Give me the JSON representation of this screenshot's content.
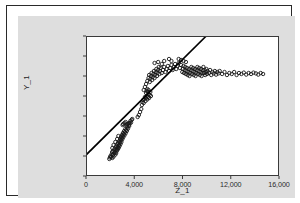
{
  "figure": {
    "background_color": "#dedede",
    "plot_background_color": "#ffffff",
    "frame_color": "#2a2a2a",
    "marker_color": "#1a1a1a",
    "line_color": "#000000"
  },
  "chart_data": {
    "type": "scatter",
    "title": "",
    "xlabel": "Z_1",
    "ylabel": "Y_1",
    "xlim": [
      0,
      16000
    ],
    "ylim": [
      1000,
      8000
    ],
    "xticks": [
      0,
      4000,
      8000,
      12000,
      16000
    ],
    "yticks": [
      1000,
      2000,
      3000,
      4000,
      5000,
      6000,
      7000,
      8000
    ],
    "xtick_labels": [
      "0",
      "4,000",
      "8,000",
      "12,000",
      "16,000"
    ],
    "ytick_labels": [
      "1,000",
      "2,000",
      "3,000",
      "4,000",
      "5,000",
      "6,000",
      "7,000",
      "8,000"
    ],
    "grid": false,
    "legend": null,
    "marker_style": "open-circle",
    "series": [
      {
        "name": "observations",
        "points": [
          [
            1850,
            1900
          ],
          [
            1900,
            1980
          ],
          [
            1950,
            2050
          ],
          [
            2000,
            2000
          ],
          [
            2050,
            2150
          ],
          [
            2080,
            2250
          ],
          [
            2100,
            1950
          ],
          [
            2150,
            2100
          ],
          [
            2180,
            2300
          ],
          [
            2200,
            2020
          ],
          [
            2250,
            2180
          ],
          [
            2280,
            2400
          ],
          [
            2300,
            2250
          ],
          [
            2350,
            2120
          ],
          [
            2380,
            2350
          ],
          [
            2400,
            2480
          ],
          [
            2420,
            2200
          ],
          [
            2450,
            2550
          ],
          [
            2480,
            2320
          ],
          [
            2500,
            2420
          ],
          [
            2520,
            2650
          ],
          [
            2550,
            2380
          ],
          [
            2580,
            2500
          ],
          [
            2600,
            2700
          ],
          [
            2620,
            2450
          ],
          [
            2650,
            2600
          ],
          [
            2680,
            2800
          ],
          [
            2700,
            2550
          ],
          [
            2720,
            2720
          ],
          [
            2750,
            2900
          ],
          [
            2780,
            2650
          ],
          [
            2800,
            2850
          ],
          [
            2820,
            3000
          ],
          [
            2850,
            2750
          ],
          [
            2880,
            2950
          ],
          [
            2900,
            3100
          ],
          [
            2920,
            2880
          ],
          [
            2950,
            3050
          ],
          [
            2980,
            3200
          ],
          [
            3000,
            2980
          ],
          [
            3050,
            3150
          ],
          [
            3080,
            3300
          ],
          [
            3100,
            3080
          ],
          [
            3150,
            3250
          ],
          [
            3180,
            3420
          ],
          [
            3200,
            3180
          ],
          [
            3250,
            3350
          ],
          [
            3280,
            3550
          ],
          [
            3300,
            3300
          ],
          [
            3350,
            3480
          ],
          [
            3380,
            3650
          ],
          [
            3400,
            3420
          ],
          [
            3450,
            3580
          ],
          [
            3480,
            3700
          ],
          [
            3500,
            3550
          ],
          [
            3550,
            3680
          ],
          [
            3600,
            3800
          ],
          [
            3650,
            3720
          ],
          [
            3700,
            3850
          ],
          [
            3750,
            3900
          ],
          [
            2950,
            3600
          ],
          [
            3000,
            3650
          ],
          [
            3100,
            3700
          ],
          [
            3200,
            3750
          ],
          [
            3300,
            3640
          ],
          [
            4200,
            4000
          ],
          [
            4300,
            4100
          ],
          [
            4400,
            4250
          ],
          [
            4500,
            4400
          ],
          [
            4550,
            4600
          ],
          [
            4600,
            4750
          ],
          [
            4650,
            4850
          ],
          [
            4700,
            4700
          ],
          [
            4750,
            4900
          ],
          [
            4800,
            5000
          ],
          [
            4850,
            4800
          ],
          [
            4900,
            4950
          ],
          [
            4950,
            5050
          ],
          [
            5000,
            4880
          ],
          [
            5050,
            5000
          ],
          [
            5100,
            5150
          ],
          [
            5150,
            4950
          ],
          [
            5200,
            5100
          ],
          [
            5250,
            5250
          ],
          [
            5300,
            5050
          ],
          [
            4700,
            5350
          ],
          [
            4800,
            5500
          ],
          [
            4900,
            5650
          ],
          [
            5000,
            5800
          ],
          [
            5100,
            5950
          ],
          [
            5150,
            6100
          ],
          [
            5200,
            5750
          ],
          [
            5250,
            5900
          ],
          [
            5300,
            6050
          ],
          [
            5350,
            6200
          ],
          [
            5400,
            5850
          ],
          [
            5450,
            6000
          ],
          [
            5500,
            6150
          ],
          [
            5550,
            6300
          ],
          [
            5600,
            5950
          ],
          [
            5650,
            6100
          ],
          [
            5700,
            6250
          ],
          [
            5750,
            6400
          ],
          [
            5800,
            6050
          ],
          [
            5850,
            6200
          ],
          [
            5900,
            6350
          ],
          [
            5950,
            6500
          ],
          [
            6000,
            6150
          ],
          [
            6050,
            6300
          ],
          [
            6100,
            6450
          ],
          [
            6200,
            6200
          ],
          [
            6300,
            6350
          ],
          [
            6400,
            6500
          ],
          [
            6500,
            6250
          ],
          [
            6600,
            6400
          ],
          [
            6700,
            6550
          ],
          [
            6800,
            6300
          ],
          [
            6900,
            6450
          ],
          [
            7000,
            6600
          ],
          [
            7100,
            6350
          ],
          [
            7200,
            6500
          ],
          [
            7300,
            6650
          ],
          [
            7400,
            6400
          ],
          [
            7500,
            6550
          ],
          [
            7600,
            6700
          ],
          [
            7700,
            6450
          ],
          [
            7800,
            6600
          ],
          [
            7900,
            6250
          ],
          [
            7950,
            6400
          ],
          [
            8000,
            6550
          ],
          [
            8050,
            6200
          ],
          [
            8100,
            6350
          ],
          [
            8150,
            6500
          ],
          [
            8200,
            6150
          ],
          [
            8250,
            6300
          ],
          [
            8300,
            6450
          ],
          [
            8350,
            6100
          ],
          [
            8400,
            6250
          ],
          [
            8450,
            6400
          ],
          [
            8500,
            6050
          ],
          [
            8550,
            6200
          ],
          [
            8600,
            6350
          ],
          [
            8650,
            6500
          ],
          [
            8700,
            6150
          ],
          [
            8750,
            6300
          ],
          [
            8800,
            6450
          ],
          [
            8850,
            6100
          ],
          [
            8900,
            6250
          ],
          [
            8950,
            6400
          ],
          [
            9000,
            6050
          ],
          [
            9050,
            6200
          ],
          [
            9100,
            6350
          ],
          [
            9150,
            6500
          ],
          [
            9200,
            6150
          ],
          [
            9250,
            6300
          ],
          [
            9300,
            6450
          ],
          [
            9350,
            6100
          ],
          [
            9400,
            6250
          ],
          [
            9450,
            6400
          ],
          [
            9500,
            6050
          ],
          [
            9550,
            6200
          ],
          [
            9600,
            6350
          ],
          [
            9650,
            6500
          ],
          [
            9700,
            6200
          ],
          [
            9750,
            6350
          ],
          [
            9800,
            6100
          ],
          [
            9850,
            6250
          ],
          [
            9900,
            6400
          ],
          [
            9950,
            6150
          ],
          [
            10000,
            6300
          ],
          [
            10100,
            6200
          ],
          [
            10200,
            6350
          ],
          [
            10300,
            6100
          ],
          [
            10400,
            6250
          ],
          [
            10500,
            6180
          ],
          [
            10600,
            6300
          ],
          [
            10700,
            6120
          ],
          [
            10800,
            6250
          ],
          [
            10900,
            6180
          ],
          [
            11000,
            6300
          ],
          [
            11200,
            6150
          ],
          [
            11400,
            6250
          ],
          [
            11600,
            6100
          ],
          [
            11800,
            6200
          ],
          [
            12000,
            6150
          ],
          [
            12200,
            6250
          ],
          [
            12400,
            6100
          ],
          [
            12600,
            6200
          ],
          [
            12800,
            6150
          ],
          [
            13000,
            6220
          ],
          [
            13200,
            6120
          ],
          [
            13400,
            6200
          ],
          [
            13600,
            6150
          ],
          [
            13800,
            6220
          ],
          [
            14000,
            6180
          ],
          [
            14200,
            6120
          ],
          [
            14400,
            6200
          ],
          [
            14600,
            6150
          ],
          [
            7600,
            6900
          ],
          [
            7800,
            6850
          ],
          [
            8000,
            6800
          ],
          [
            8200,
            6750
          ],
          [
            6800,
            6900
          ],
          [
            7000,
            6800
          ],
          [
            5600,
            6700
          ],
          [
            5900,
            6750
          ],
          [
            6200,
            6650
          ],
          [
            6400,
            6800
          ],
          [
            4900,
            5200
          ],
          [
            4950,
            5300
          ],
          [
            5000,
            5400
          ],
          [
            5050,
            5250
          ],
          [
            5100,
            5350
          ],
          [
            2100,
            2450
          ],
          [
            2200,
            2600
          ],
          [
            2350,
            2750
          ],
          [
            2500,
            2900
          ],
          [
            2600,
            3050
          ]
        ]
      }
    ],
    "fit_line": {
      "name": "regression-line",
      "x_start": 0,
      "y_start": 2150,
      "x_end": 9800,
      "y_end": 8000,
      "slope": 0.597,
      "intercept": 2150
    }
  }
}
